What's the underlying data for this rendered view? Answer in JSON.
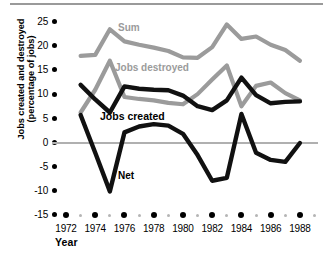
{
  "axes": {
    "ylabel_line1": "Jobs created and destroyed",
    "ylabel_line2": "(percentage of jobs)",
    "xlabel": "Year",
    "yticks": [
      "25",
      "20",
      "15",
      "10",
      "5",
      "0",
      "-5",
      "-10",
      "-15"
    ],
    "xticks": [
      "1972",
      "1974",
      "1976",
      "1978",
      "1980",
      "1982",
      "1984",
      "1986",
      "1988"
    ]
  },
  "series_labels": {
    "sum": "Sum",
    "destroyed": "Jobs destroyed",
    "created": "Jobs created",
    "net": "Net"
  },
  "colors": {
    "gray": "#9b9b9b",
    "black": "#111111",
    "zero_line": "#b0b0b0",
    "tick": "#000000"
  },
  "chart_data": {
    "type": "line",
    "title": "",
    "xlabel": "Year",
    "ylabel": "Jobs created and destroyed (percentage of jobs)",
    "xlim": [
      1972,
      1989
    ],
    "ylim": [
      -15,
      25
    ],
    "ytick_values": [
      25,
      20,
      15,
      10,
      5,
      0,
      -5,
      -10,
      -15
    ],
    "xtick_values": [
      1972,
      1974,
      1976,
      1978,
      1980,
      1982,
      1984,
      1986,
      1988
    ],
    "xtick_minor_values": [
      1973,
      1975,
      1977,
      1979,
      1981,
      1983,
      1985,
      1987,
      1989
    ],
    "grid": false,
    "legend": "inline-annotations",
    "zero_line": 0,
    "x": [
      1973,
      1974,
      1975,
      1976,
      1977,
      1978,
      1979,
      1980,
      1981,
      1982,
      1983,
      1984,
      1985,
      1986,
      1987,
      1988
    ],
    "series": [
      {
        "name": "Sum",
        "color": "#9b9b9b",
        "values": [
          18.0,
          18.2,
          23.5,
          21.0,
          20.3,
          19.7,
          19.0,
          17.7,
          17.6,
          19.8,
          24.5,
          21.5,
          22.0,
          20.3,
          19.2,
          17.0
        ]
      },
      {
        "name": "Jobs destroyed",
        "color": "#9b9b9b",
        "values": [
          6.3,
          11.0,
          17.0,
          9.5,
          9.1,
          8.8,
          8.3,
          8.0,
          10.1,
          13.1,
          16.0,
          7.6,
          11.8,
          12.5,
          10.3,
          8.8
        ]
      },
      {
        "name": "Jobs created",
        "color": "#111111",
        "values": [
          12.0,
          9.0,
          6.3,
          11.7,
          11.2,
          11.0,
          10.9,
          9.8,
          7.6,
          6.8,
          8.8,
          13.5,
          9.9,
          8.2,
          8.5,
          8.6
        ]
      },
      {
        "name": "Net",
        "color": "#111111",
        "values": [
          5.8,
          -2.0,
          -10.0,
          2.2,
          3.4,
          3.9,
          3.6,
          1.9,
          -2.5,
          -7.8,
          -7.2,
          6.0,
          -2.0,
          -3.5,
          -3.9,
          0.0
        ]
      }
    ]
  }
}
